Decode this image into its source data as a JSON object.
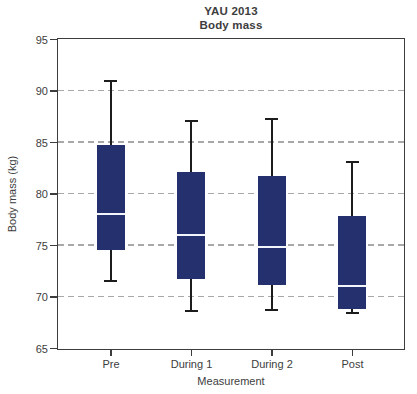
{
  "figure": {
    "title": "YAU 2013",
    "subtitle": "Body mass"
  },
  "chart_data": {
    "type": "boxplot",
    "title": "YAU 2013",
    "subtitle": "Body mass",
    "xlabel": "Measurement",
    "ylabel": "Body mass (kg)",
    "categories": [
      "Pre",
      "During 1",
      "During 2",
      "Post"
    ],
    "ylim": [
      65,
      95
    ],
    "yticks": [
      95,
      90,
      85,
      80,
      75,
      70,
      65
    ],
    "grid_values": [
      90,
      85,
      80,
      75,
      70
    ],
    "grid_style": "dashed-horizontal",
    "legend": null,
    "series": [
      {
        "category": "Pre",
        "whisker_low": 71.5,
        "q1": 74.5,
        "median": 78.0,
        "q3": 84.7,
        "whisker_high": 90.9
      },
      {
        "category": "During 1",
        "whisker_low": 68.6,
        "q1": 71.7,
        "median": 76.0,
        "q3": 82.1,
        "whisker_high": 87.0
      },
      {
        "category": "During 2",
        "whisker_low": 68.7,
        "q1": 71.1,
        "median": 74.8,
        "q3": 81.7,
        "whisker_high": 87.2
      },
      {
        "category": "Post",
        "whisker_low": 68.4,
        "q1": 68.8,
        "median": 71.0,
        "q3": 77.8,
        "whisker_high": 83.1
      }
    ],
    "colors": {
      "box_fill": "#25316e",
      "median_line": "#f2f5fb",
      "whisker": "#1c1c1c",
      "grid": "#a8a8a8",
      "axis": "#3d3d3d",
      "text": "#3d3d3d",
      "background": "#ffffff"
    }
  }
}
